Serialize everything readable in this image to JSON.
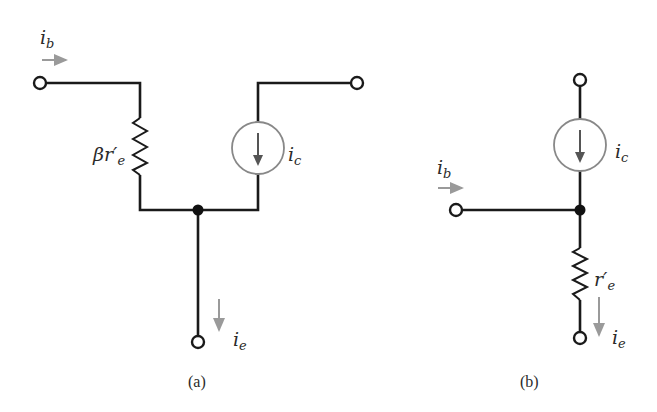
{
  "figure": {
    "panels": [
      {
        "caption": "(a)",
        "labels": {
          "base_current": {
            "main": "i",
            "sub": "b"
          },
          "resistor": {
            "main": "βr′",
            "sub": "e"
          },
          "collector_current": {
            "main": "i",
            "sub": "c"
          },
          "emitter_current": {
            "main": "i",
            "sub": "e"
          }
        }
      },
      {
        "caption": "(b)",
        "labels": {
          "base_current": {
            "main": "i",
            "sub": "b"
          },
          "collector_current": {
            "main": "i",
            "sub": "c"
          },
          "resistor": {
            "main": "r′",
            "sub": "e"
          },
          "emitter_current": {
            "main": "i",
            "sub": "e"
          }
        }
      }
    ],
    "colors": {
      "wire": "#1a1a1a",
      "arrow": "#9a9a9a",
      "source_circle": "#888888"
    }
  }
}
